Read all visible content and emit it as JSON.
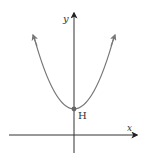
{
  "diagram": {
    "type": "parabola-graph",
    "axes": {
      "x_label": "x",
      "y_label": "y"
    },
    "curve": {
      "shape": "upward-opening parabola",
      "color": "#777777"
    },
    "vertex": {
      "label": "H",
      "position": "on y-axis, above origin"
    },
    "colors": {
      "axis": "#333333",
      "curve": "#777777",
      "point": "#666666"
    }
  }
}
